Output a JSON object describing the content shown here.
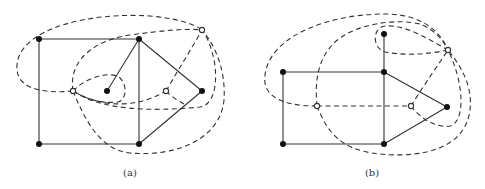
{
  "figure": {
    "panels": [
      {
        "id": "a",
        "caption": "(a)",
        "primal_vertices": [
          {
            "id": "tl",
            "x": 39,
            "y": 39
          },
          {
            "id": "tm",
            "x": 139,
            "y": 39
          },
          {
            "id": "bl",
            "x": 39,
            "y": 144
          },
          {
            "id": "bm",
            "x": 139,
            "y": 144
          },
          {
            "id": "c",
            "x": 107,
            "y": 91
          },
          {
            "id": "r",
            "x": 202,
            "y": 91
          }
        ],
        "dual_vertices": [
          {
            "id": "ol",
            "x": 73,
            "y": 91
          },
          {
            "id": "om",
            "x": 166,
            "y": 91
          },
          {
            "id": "ot",
            "x": 202,
            "y": 30
          }
        ]
      },
      {
        "id": "b",
        "caption": "(b)",
        "primal_vertices": [
          {
            "id": "tl",
            "x": 283,
            "y": 72
          },
          {
            "id": "tm",
            "x": 384,
            "y": 72
          },
          {
            "id": "bl",
            "x": 283,
            "y": 144
          },
          {
            "id": "bm",
            "x": 384,
            "y": 144
          },
          {
            "id": "top",
            "x": 384,
            "y": 34
          },
          {
            "id": "r",
            "x": 447,
            "y": 107
          }
        ],
        "dual_vertices": [
          {
            "id": "ol",
            "x": 317,
            "y": 106
          },
          {
            "id": "om",
            "x": 411,
            "y": 106
          },
          {
            "id": "ot",
            "x": 448,
            "y": 50
          }
        ]
      }
    ],
    "legend": {
      "primal_edge_style": "solid",
      "dual_edge_style": "dashed",
      "primal_vertex": "filled-circle",
      "dual_vertex": "open-circle"
    },
    "colors": {
      "stroke": "#333333",
      "vertex_fill": "#111111",
      "background": "#ffffff"
    }
  }
}
